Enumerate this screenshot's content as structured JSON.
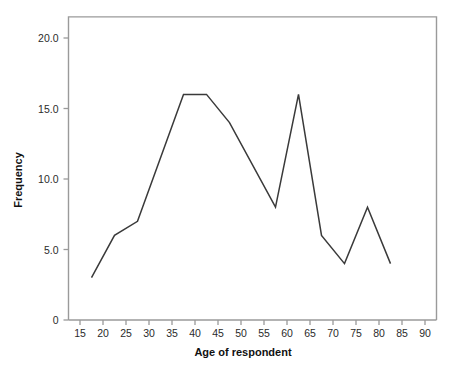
{
  "chart_data": {
    "type": "line",
    "title": "",
    "xlabel": "Age of respondent",
    "ylabel": "Frequency",
    "xlim": [
      12.5,
      92.5
    ],
    "ylim": [
      0,
      21.5
    ],
    "grid": false,
    "legend": "none",
    "line_color": "#3a3a3a",
    "axis_color": "#9a9a9a",
    "x": [
      17.5,
      22.5,
      27.5,
      37.5,
      42.5,
      47.5,
      57.5,
      62.5,
      67.5,
      72.5,
      77.5,
      82.5
    ],
    "values": [
      3,
      6,
      7,
      16,
      16,
      14,
      8,
      16,
      6,
      4,
      8,
      4
    ],
    "series": [
      {
        "name": "Frequency",
        "points": [
          {
            "x": 17.5,
            "y": 3
          },
          {
            "x": 22.5,
            "y": 6
          },
          {
            "x": 27.5,
            "y": 7
          },
          {
            "x": 37.5,
            "y": 16
          },
          {
            "x": 42.5,
            "y": 16
          },
          {
            "x": 47.5,
            "y": 14
          },
          {
            "x": 57.5,
            "y": 8
          },
          {
            "x": 62.5,
            "y": 16
          },
          {
            "x": 67.5,
            "y": 6
          },
          {
            "x": 72.5,
            "y": 4
          },
          {
            "x": 77.5,
            "y": 8
          },
          {
            "x": 82.5,
            "y": 4
          }
        ]
      }
    ],
    "xticks": [
      15,
      20,
      25,
      30,
      35,
      40,
      45,
      50,
      55,
      60,
      65,
      70,
      75,
      80,
      85,
      90
    ],
    "xticklabels": [
      "15",
      "20",
      "25",
      "30",
      "35",
      "40",
      "45",
      "50",
      "55",
      "60",
      "65",
      "70",
      "75",
      "80",
      "85",
      "90"
    ],
    "yticks": [
      0,
      5,
      10,
      15,
      20
    ],
    "yticklabels": [
      "0",
      "5.0",
      "10.0",
      "15.0",
      "20.0"
    ]
  }
}
